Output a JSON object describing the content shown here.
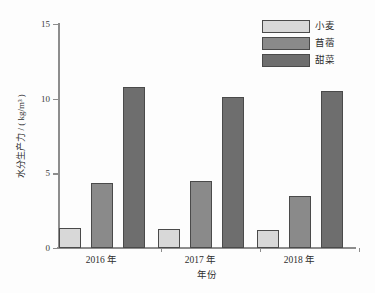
{
  "chart_data": {
    "type": "bar",
    "title": "",
    "xlabel": "年份",
    "ylabel": "水分生产力 / ( kg/m³ )",
    "categories": [
      "2016 年",
      "2017 年",
      "2018 年"
    ],
    "ylim": [
      0,
      15
    ],
    "yticks": [
      "0",
      "5",
      "10",
      "15"
    ],
    "ytick_values": [
      0,
      5,
      10,
      15
    ],
    "grid": false,
    "legend_position": "top-right",
    "series": [
      {
        "name": "小麦",
        "color": "#d8d8d8",
        "values": [
          1.35,
          1.28,
          1.2
        ]
      },
      {
        "name": "苜蓿",
        "color": "#8a8a8a",
        "values": [
          4.35,
          4.5,
          3.5
        ]
      },
      {
        "name": "甜菜",
        "color": "#6e6e6e",
        "values": [
          10.8,
          10.1,
          10.5
        ]
      }
    ]
  },
  "legend": {
    "items": [
      {
        "label": "小麦",
        "color": "#d8d8d8"
      },
      {
        "label": "苜蓿",
        "color": "#8a8a8a"
      },
      {
        "label": "甜菜",
        "color": "#6e6e6e"
      }
    ]
  },
  "axes": {
    "y_title": "水分生产力 / ( kg/m³ )",
    "x_title": "年份",
    "y_tick_labels": [
      "0",
      "5",
      "10",
      "15"
    ],
    "x_tick_labels": [
      "2016 年",
      "2017 年",
      "2018 年"
    ]
  }
}
